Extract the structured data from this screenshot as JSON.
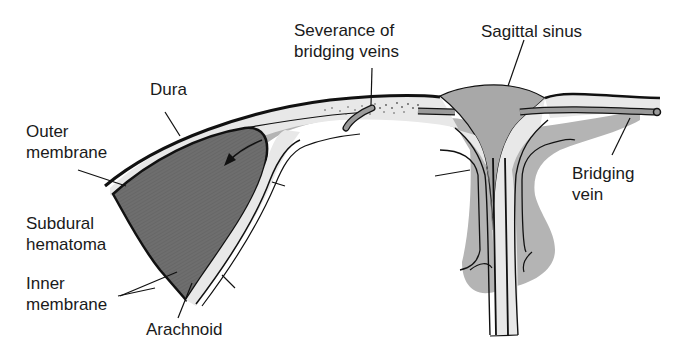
{
  "diagram": {
    "colors": {
      "background": "#ffffff",
      "hematoma": "#6b6b6b",
      "brain_gray": "#b4b4b4",
      "sinus": "#a8a8a8",
      "dura_light": "#e6e6e6",
      "outline": "#111111"
    },
    "labels": {
      "dura": "Dura",
      "outer_membrane": "Outer\nmembrane",
      "subdural_hematoma": "Subdural\nhematoma",
      "inner_membrane": "Inner\nmembrane",
      "arachnoid": "Arachnoid",
      "severance": "Severance of\nbridging veins",
      "sagittal_sinus": "Sagittal sinus",
      "bridging_vein": "Bridging\nvein"
    }
  }
}
